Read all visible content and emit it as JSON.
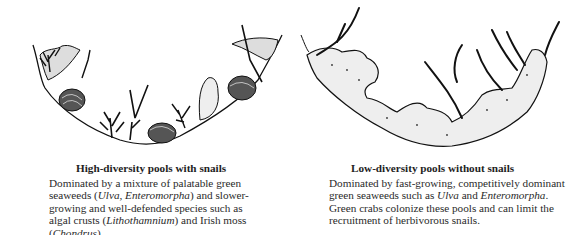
{
  "panels": [
    {
      "id": "high-diversity",
      "title": "High-diversity pools with snails",
      "description_parts": [
        {
          "text": "Dominated by a mixture of palatable green seaweeds (",
          "italic": false
        },
        {
          "text": "Ulva, Enteromorpha",
          "italic": true
        },
        {
          "text": ") and slower-growing and well-defended species such as algal crusts (",
          "italic": false
        },
        {
          "text": "Lithothamnium",
          "italic": true
        },
        {
          "text": ") and Irish moss (",
          "italic": false
        },
        {
          "text": "Chondrus",
          "italic": true
        },
        {
          "text": ").",
          "italic": false
        }
      ],
      "illustration": "Cross-section of tide pool with snails, branching algae and crusts"
    },
    {
      "id": "low-diversity",
      "title": "Low-diversity pools without snails",
      "description_parts": [
        {
          "text": "Dominated by fast-growing, competitively dominant green seaweeds such as ",
          "italic": false
        },
        {
          "text": "Ulva",
          "italic": true
        },
        {
          "text": " and ",
          "italic": false
        },
        {
          "text": "Enteromorpha",
          "italic": true
        },
        {
          "text": ".  Green crabs colonize these pools and can limit the recruitment of herbivorous snails.",
          "italic": false
        }
      ],
      "illustration": "Cross-section of tide pool overgrown by green seaweed mats, no snails"
    }
  ]
}
